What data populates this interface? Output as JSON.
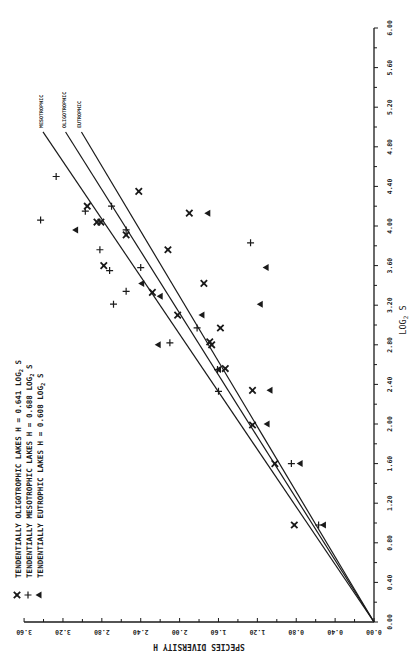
{
  "chart_data": {
    "type": "scatter",
    "orientation_note": "figure printed rotated 90 degrees; H axis along bottom (reversed), log2 S axis along right side",
    "title": "",
    "xlabel": "LOG2 S",
    "ylabel": "SPECIES DIVERSITY H",
    "xlim": [
      0.0,
      6.0
    ],
    "ylim": [
      0.0,
      3.6
    ],
    "x_ticks": [
      "0.00",
      "0.40",
      "0.80",
      "1.20",
      "1.60",
      "2.00",
      "2.40",
      "2.80",
      "3.20",
      "3.60",
      "4.00",
      "4.40",
      "4.80",
      "5.20",
      "5.60",
      "6.00"
    ],
    "y_ticks": [
      "0.00",
      "0.40",
      "0.80",
      "1.20",
      "1.60",
      "2.00",
      "2.40",
      "2.80",
      "3.20",
      "3.60"
    ],
    "grid": false,
    "legend": [
      {
        "marker": "x",
        "label": "TENDENTIALLY OLIGOTROPHIC LAKES",
        "equation": "H = 0.641 LOG2 S"
      },
      {
        "marker": "+",
        "label": "TENDENTIALLY MESOTROPHIC LAKES",
        "equation": "H = 0.688 LOG2 S"
      },
      {
        "marker": "triangle",
        "label": "TENDENTIALLY EUTROPHIC LAKES",
        "equation": "H = 0.608 LOG2 S"
      }
    ],
    "lines": [
      {
        "name": "MESOTROPHIC",
        "slope": 0.688,
        "x_end": 4.95
      },
      {
        "name": "OLIGOTROPHIC",
        "slope": 0.641,
        "x_end": 4.95
      },
      {
        "name": "EUTROPHIC",
        "slope": 0.608,
        "x_end": 4.95
      }
    ],
    "series": [
      {
        "name": "TENDENTIALLY OLIGOTROPHIC LAKES",
        "marker": "x",
        "points": [
          [
            0.98,
            0.82
          ],
          [
            1.6,
            1.02
          ],
          [
            1.99,
            1.25
          ],
          [
            2.34,
            1.25
          ],
          [
            2.56,
            1.53
          ],
          [
            2.8,
            1.67
          ],
          [
            2.83,
            1.69
          ],
          [
            2.97,
            1.58
          ],
          [
            3.1,
            2.02
          ],
          [
            3.33,
            2.28
          ],
          [
            3.42,
            1.75
          ],
          [
            3.6,
            2.78
          ],
          [
            3.76,
            2.12
          ],
          [
            3.91,
            2.55
          ],
          [
            4.04,
            2.81
          ],
          [
            4.04,
            2.85
          ],
          [
            4.13,
            1.9
          ],
          [
            4.2,
            2.95
          ],
          [
            4.35,
            2.42
          ]
        ]
      },
      {
        "name": "TENDENTIALLY MESOTROPHIC LAKES",
        "marker": "+",
        "points": [
          [
            0.98,
            0.57
          ],
          [
            1.6,
            0.85
          ],
          [
            2.33,
            1.6
          ],
          [
            2.55,
            1.61
          ],
          [
            2.82,
            2.1
          ],
          [
            2.97,
            1.82
          ],
          [
            3.21,
            2.68
          ],
          [
            3.34,
            2.55
          ],
          [
            3.55,
            2.72
          ],
          [
            3.58,
            2.4
          ],
          [
            3.76,
            2.82
          ],
          [
            3.83,
            1.27
          ],
          [
            3.96,
            2.55
          ],
          [
            4.06,
            3.43
          ],
          [
            4.15,
            2.97
          ],
          [
            4.2,
            2.7
          ],
          [
            4.5,
            3.27
          ]
        ]
      },
      {
        "name": "TENDENTIALLY EUTROPHIC LAKES",
        "marker": "triangle",
        "points": [
          [
            0.98,
            0.52
          ],
          [
            1.6,
            0.76
          ],
          [
            2.0,
            1.1
          ],
          [
            2.34,
            1.07
          ],
          [
            2.55,
            1.6
          ],
          [
            2.8,
            2.22
          ],
          [
            3.1,
            1.77
          ],
          [
            3.21,
            1.17
          ],
          [
            3.29,
            2.2
          ],
          [
            3.42,
            2.39
          ],
          [
            3.58,
            1.11
          ],
          [
            3.96,
            3.07
          ],
          [
            4.13,
            1.71
          ]
        ]
      }
    ]
  },
  "labels": {
    "x_axis_label": "LOG",
    "x_axis_sub": "2",
    "x_axis_var": "S",
    "y_axis_label": "SPECIES DIVERSITY H",
    "legend_rows": [
      {
        "marker": "x",
        "group": "TENDENTIALLY OLIGOTROPHIC LAKES",
        "eq": "H = 0.641",
        "log": "LOG",
        "sub": "2",
        "var": "S"
      },
      {
        "marker": "+",
        "group": "TENDENTIALLY MESOTROPHIC  LAKES",
        "eq": "H = 0.688",
        "log": "LOG",
        "sub": "2",
        "var": "S"
      },
      {
        "marker": "triangle",
        "group": "TENDENTIALLY EUTROPHIC    LAKES",
        "eq": "H = 0.608",
        "log": "LOG",
        "sub": "2",
        "var": "S"
      }
    ],
    "line_labels": [
      "MESOTROPHIC",
      "OLIGOTROPHIC",
      "EUTROPHIC"
    ]
  }
}
